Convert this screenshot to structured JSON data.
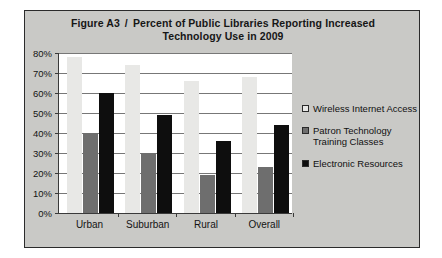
{
  "figure": {
    "label": "Figure A3",
    "separator": "/",
    "title_line1": "Percent of Public Libraries Reporting Increased",
    "title_line2": "Technology Use in 2009"
  },
  "colors": {
    "series_wireless": "#e8e8e6",
    "series_patron": "#6e6e6e",
    "series_electronic": "#0e0e0e",
    "frame_background": "#c9c9c6",
    "plot_background": "#ffffff",
    "axis": "#3a3a3a",
    "gridline": "#777777"
  },
  "chart_data": {
    "type": "bar",
    "xlabel": "",
    "ylabel": "",
    "categories": [
      "Urban",
      "Suburban",
      "Rural",
      "Overall"
    ],
    "series": [
      {
        "name": "Wireless Internet Access",
        "values": [
          78,
          74,
          66,
          68
        ]
      },
      {
        "name": "Patron Technology Training Classes",
        "values": [
          40,
          30,
          19,
          23
        ]
      },
      {
        "name": "Electronic Resources",
        "values": [
          60,
          49,
          36,
          44
        ]
      }
    ],
    "ylim": [
      0,
      80
    ],
    "ytick_values": [
      0,
      10,
      20,
      30,
      40,
      50,
      60,
      70,
      80
    ],
    "ytick_labels": [
      "0%",
      "10%",
      "20%",
      "30%",
      "40%",
      "50%",
      "60%",
      "70%",
      "80%"
    ],
    "grid": true,
    "legend_position": "right"
  }
}
